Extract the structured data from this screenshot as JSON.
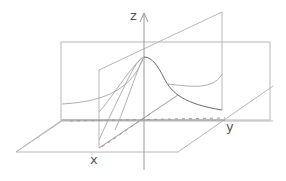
{
  "diagram": {
    "type": "3d-coordinate-sketch",
    "axes": {
      "z": {
        "label": "z"
      },
      "y": {
        "label": "y"
      },
      "x": {
        "label": "x"
      }
    },
    "colors": {
      "background": "#ffffff",
      "lines": "#b8b8b8",
      "axes": "#9a9a9a",
      "main_curve": "#6a6a6a",
      "labels": "#555555"
    }
  }
}
